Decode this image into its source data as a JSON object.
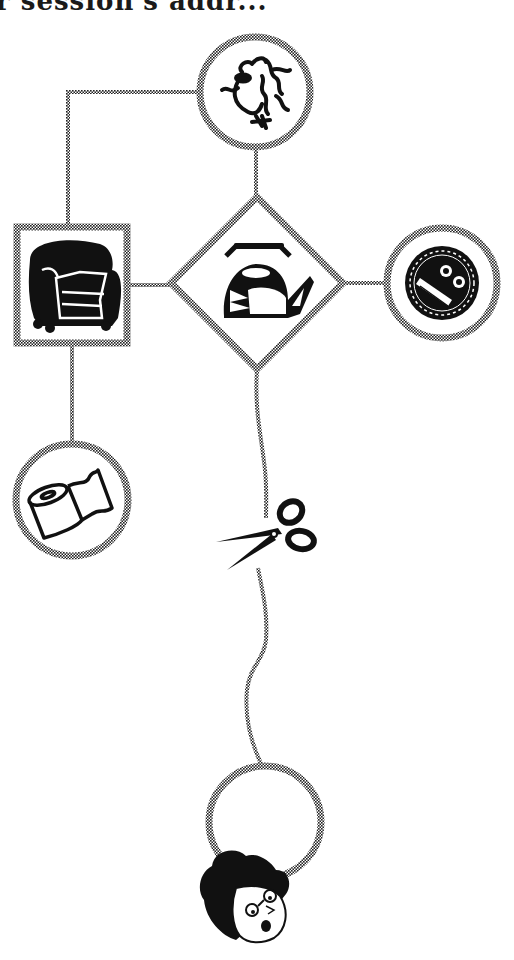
{
  "header": {
    "clipped_text": "r session's addr..."
  },
  "diagram": {
    "stroke_color": "#555555",
    "ink_color": "#111111",
    "nodes": [
      {
        "id": "face",
        "shape": "circle",
        "icon": "scribble-face-icon",
        "cx": 255,
        "cy": 92,
        "r": 56
      },
      {
        "id": "armchair",
        "shape": "square",
        "icon": "armchair-icon",
        "x": 16,
        "y": 226,
        "w": 112,
        "h": 118
      },
      {
        "id": "kettle",
        "shape": "diamond",
        "icon": "kettle-icon",
        "cx": 257,
        "cy": 283,
        "half": 87
      },
      {
        "id": "badge",
        "shape": "circle",
        "icon": "badge-icon",
        "cx": 442,
        "cy": 283,
        "r": 56
      },
      {
        "id": "toilet-roll",
        "shape": "circle",
        "icon": "toilet-roll-icon",
        "cx": 72,
        "cy": 500,
        "r": 57
      },
      {
        "id": "empty-ring",
        "shape": "circle",
        "icon": "none",
        "cx": 265,
        "cy": 822,
        "r": 57
      }
    ],
    "decorations": [
      {
        "id": "scissors",
        "icon": "scissors-icon"
      },
      {
        "id": "head",
        "icon": "man-with-glasses-icon"
      }
    ]
  }
}
